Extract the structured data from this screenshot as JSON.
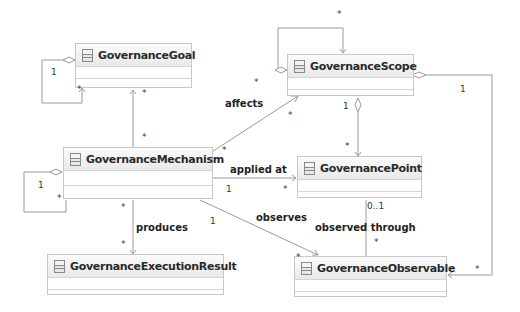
{
  "classes": [
    {
      "id": "goal",
      "name": "GovernanceGoal"
    },
    {
      "id": "scope",
      "name": "GovernanceScope"
    },
    {
      "id": "mechanism",
      "name": "GovernanceMechanism"
    },
    {
      "id": "point",
      "name": "GovernancePoint"
    },
    {
      "id": "result",
      "name": "GovernanceExecutionResult"
    },
    {
      "id": "observable",
      "name": "GovernanceObservable"
    }
  ],
  "associations": {
    "affects": "affects",
    "applied_at": "applied at",
    "produces": "produces",
    "observes": "observes",
    "observed_through": "observed through"
  },
  "multiplicities": {
    "one": "1",
    "many": "*",
    "zero_one": "0..1"
  }
}
